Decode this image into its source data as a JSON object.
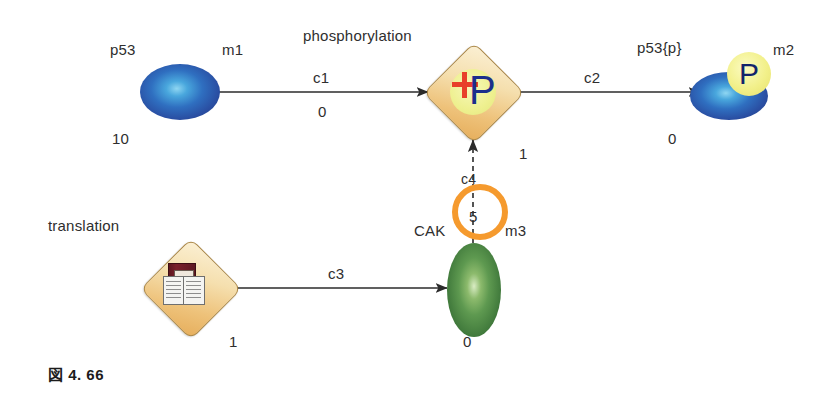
{
  "figure": {
    "caption": "図 4. 66",
    "background": "#ffffff"
  },
  "colors": {
    "species_blue": "#2f6fc0",
    "species_green": "#5e9950",
    "process_tan": "#eec27a",
    "modifier_orange": "#f59a2e",
    "phospho_yellow": "#eef08f",
    "plus_red": "#e8402a",
    "p_blue": "#1b2f8c",
    "edge": "#2b2b2b"
  },
  "nodes": {
    "p53": {
      "name": "p53",
      "id_label": "m1",
      "count": "10",
      "shape": "ellipse",
      "color": "#2f6fc0"
    },
    "phosphorylation": {
      "name": "phosphorylation",
      "count": "1",
      "shape": "diamond",
      "glyph": "plus-p-icon",
      "color": "#eec27a"
    },
    "p53p": {
      "name": "p53{p}",
      "id_label": "m2",
      "count": "0",
      "shape": "ellipse",
      "badge": "P",
      "color": "#2f6fc0"
    },
    "cak": {
      "name": "CAK",
      "id_label": "m3",
      "count": "0",
      "shape": "ellipse",
      "color": "#5e9950",
      "ring_value": "5"
    },
    "translation": {
      "name": "translation",
      "count": "1",
      "shape": "diamond",
      "glyph": "book-icon",
      "color": "#eec27a"
    }
  },
  "edges": {
    "c1": {
      "label": "c1",
      "value": "0",
      "from": "p53",
      "to": "phosphorylation",
      "style": "solid"
    },
    "c2": {
      "label": "c2",
      "from": "phosphorylation",
      "to": "p53p",
      "style": "solid"
    },
    "c3": {
      "label": "c3",
      "from": "translation",
      "to": "cak",
      "style": "solid"
    },
    "c4": {
      "label": "c4",
      "value": "5",
      "from": "cak",
      "to": "phosphorylation",
      "style": "dashed"
    }
  }
}
